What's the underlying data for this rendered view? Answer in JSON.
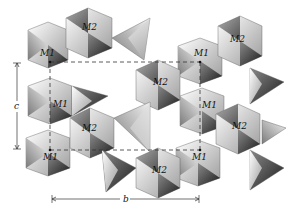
{
  "diagram": {
    "type": "crystal-structure-polyhedral",
    "site_labels": {
      "m1": "M1",
      "m2": "M2"
    },
    "axes": {
      "c": "c",
      "b": "b"
    },
    "labels": [
      {
        "text": "M2",
        "x": 82,
        "y": 30
      },
      {
        "text": "M1",
        "x": 48,
        "y": 48
      },
      {
        "text": "M1",
        "x": 53,
        "y": 107
      },
      {
        "text": "M2",
        "x": 88,
        "y": 130
      },
      {
        "text": "M1",
        "x": 46,
        "y": 159
      },
      {
        "text": "M2",
        "x": 236,
        "y": 42
      },
      {
        "text": "M1",
        "x": 197,
        "y": 55
      },
      {
        "text": "M2",
        "x": 159,
        "y": 84
      },
      {
        "text": "M1",
        "x": 202,
        "y": 108
      },
      {
        "text": "M2",
        "x": 236,
        "y": 128
      },
      {
        "text": "M2",
        "x": 157,
        "y": 172
      },
      {
        "text": "M1",
        "x": 195,
        "y": 157
      }
    ],
    "colors": {
      "light": "#eeeeee",
      "mid": "#a8a8a8",
      "dark": "#2a2a2a",
      "line": "#333333"
    }
  }
}
